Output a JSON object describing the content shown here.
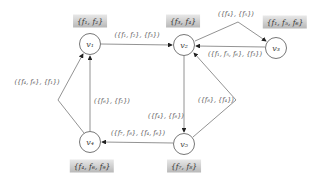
{
  "diagram": {
    "nodes": [
      {
        "id": "v1",
        "label": "v₁",
        "set": "{f₁, f₂}"
      },
      {
        "id": "v2",
        "label": "v₂",
        "set": "{f₃, f₄}"
      },
      {
        "id": "v3",
        "label": "v₃",
        "set": "{f₁, f₅, f₆}"
      },
      {
        "id": "v4",
        "label": "v₄",
        "set": "{f₄, f₆, f₉}"
      },
      {
        "id": "v5",
        "label": "v₅",
        "set": "{f₇, f₈}"
      }
    ],
    "edges": [
      {
        "from": "v1",
        "to": "v2",
        "label": "({f₁, f₂}, {f₃})"
      },
      {
        "from": "v2",
        "to": "v3",
        "label": "({f₄}, {f₅})"
      },
      {
        "from": "v3",
        "to": "v2",
        "label": "({f₁, f₅, f₆}, {f₃})"
      },
      {
        "from": "v2",
        "to": "v5",
        "label": "({f₄}, {f₈})"
      },
      {
        "from": "v5",
        "to": "v2",
        "label": "({f₈}, {f₄})"
      },
      {
        "from": "v5",
        "to": "v4",
        "label": "({f₇, f₈}, {f₄, f₆})"
      },
      {
        "from": "v4",
        "to": "v1",
        "label": "({f₆}, {f₂})"
      },
      {
        "from": "v4",
        "to": "v1",
        "label": "({f₄, f₆}, {f₁})"
      }
    ]
  }
}
